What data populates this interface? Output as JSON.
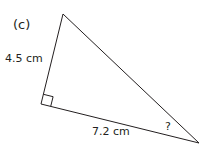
{
  "diagram": {
    "part_label": "(c)",
    "side_vertical": "4.5 cm",
    "side_base": "7.2 cm",
    "unknown_angle": "?",
    "colors": {
      "stroke": "#231f20",
      "text": "#231f20"
    }
  }
}
